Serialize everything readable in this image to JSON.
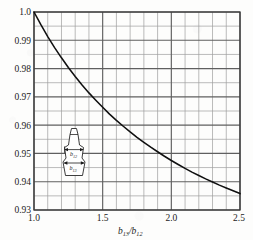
{
  "chart_data": {
    "type": "line",
    "title": "",
    "subtitle": "",
    "xlabel": "b13/b12",
    "xlabel_base": "b",
    "xlabel_sub1": "13",
    "xlabel_sep": "/",
    "xlabel_base2": "b",
    "xlabel_sub2": "12",
    "ylabel": "",
    "xlim": [
      1.0,
      2.5
    ],
    "ylim": [
      0.93,
      1.0
    ],
    "x_major_ticks": [
      "1.0",
      "1.5",
      "2.0",
      "2.5"
    ],
    "x_major_values": [
      1.0,
      1.5,
      2.0,
      2.5
    ],
    "x_minor_step": 0.1,
    "y_major_ticks": [
      "1.0",
      "0.99",
      "0.98",
      "0.97",
      "0.96",
      "0.95",
      "0.94",
      "0.93"
    ],
    "y_major_values": [
      1.0,
      0.99,
      0.98,
      0.97,
      0.96,
      0.95,
      0.94,
      0.93
    ],
    "y_minor_step": 0.005,
    "grid": true,
    "grid_color": "#6f6f6f",
    "minor_grid_color": "#9a9a9a",
    "curve_color": "#101010",
    "legend": [],
    "series": [
      {
        "name": "correction factor",
        "x": [
          1.0,
          1.05,
          1.1,
          1.15,
          1.2,
          1.25,
          1.3,
          1.35,
          1.4,
          1.45,
          1.5,
          1.55,
          1.6,
          1.65,
          1.7,
          1.75,
          1.8,
          1.85,
          1.9,
          1.95,
          2.0,
          2.05,
          2.1,
          2.15,
          2.2,
          2.25,
          2.3,
          2.35,
          2.4,
          2.45,
          2.5
        ],
        "values": [
          1.0,
          0.9955,
          0.9913,
          0.9874,
          0.9838,
          0.9804,
          0.9772,
          0.9742,
          0.9714,
          0.9688,
          0.9663,
          0.9639,
          0.9617,
          0.9596,
          0.9576,
          0.9557,
          0.9539,
          0.9522,
          0.9506,
          0.949,
          0.9475,
          0.9461,
          0.9447,
          0.9434,
          0.9422,
          0.941,
          0.9399,
          0.9388,
          0.9378,
          0.9368,
          0.9358
        ]
      }
    ],
    "annotations": [
      {
        "name": "furnace-cross-section-inset",
        "labels": [
          {
            "base": "b",
            "sub": "12"
          },
          {
            "base": "b",
            "sub": "13"
          }
        ]
      }
    ]
  },
  "inset": {
    "upper_label_base": "b",
    "upper_label_sub": "12",
    "lower_label_base": "b",
    "lower_label_sub": "13"
  }
}
